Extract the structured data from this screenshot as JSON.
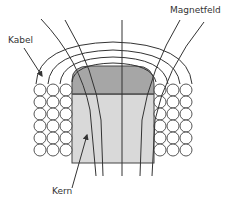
{
  "diagram": {
    "type": "electromagnet-cross-section",
    "labels": {
      "cable": "Kabel",
      "magnetic_field": "Magnetfeld",
      "core": "Kern"
    },
    "colors": {
      "background": "#ffffff",
      "core_body": "#d9d9d9",
      "core_top": "#a6a6a6",
      "stroke": "#333333",
      "coil_fill": "#ffffff"
    },
    "coil": {
      "columns_per_side": 3,
      "rows": 7
    },
    "field_lines_count": 5,
    "outer_arcs_count": 4
  }
}
